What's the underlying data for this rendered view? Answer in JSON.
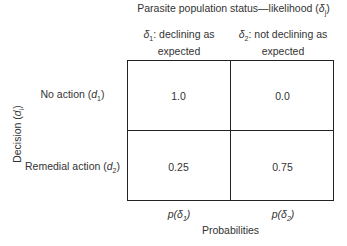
{
  "title": "Parasite population status—likelihood (δj)",
  "title_parts": {
    "text": "Parasite population status—likelihood (",
    "sym": "δ",
    "sub": "j",
    "end": ")"
  },
  "columns": [
    {
      "sym": "δ",
      "sub": "1",
      "label_line1": ": declining as",
      "label_line2": "expected"
    },
    {
      "sym": "δ",
      "sub": "2",
      "label_line1": ": not declining as",
      "label_line2": "expected"
    }
  ],
  "rows": [
    {
      "label": "No action (",
      "sym": "d",
      "sub": "1",
      "end": ")",
      "values": [
        "1.0",
        "0.0"
      ]
    },
    {
      "label": "Remedial action (",
      "sym": "d",
      "sub": "2",
      "end": ")",
      "values": [
        "0.25",
        "0.75"
      ]
    }
  ],
  "row_axis": {
    "label": "Decision (",
    "sym": "d",
    "sub": "i",
    "end": ")"
  },
  "probabilities": {
    "title": "Probabilities",
    "items": [
      {
        "pre": "p(",
        "sym": "δ",
        "sub": "1",
        "end": ")"
      },
      {
        "pre": "p(",
        "sym": "δ",
        "sub": "2",
        "end": ")"
      }
    ]
  }
}
